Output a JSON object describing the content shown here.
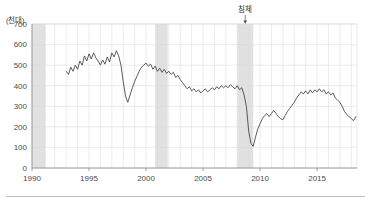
{
  "chart_data": {
    "type": "line",
    "title": "",
    "subtitle": "",
    "unit_label": "(천대)",
    "xlabel": "",
    "ylabel": "",
    "xlim": [
      1990,
      2018.5
    ],
    "ylim": [
      0,
      700
    ],
    "grid": true,
    "legend": false,
    "y_ticks": [
      0,
      100,
      200,
      300,
      400,
      500,
      600,
      700
    ],
    "y_tick_labels": [
      "0",
      "100",
      "200",
      "300",
      "400",
      "500",
      "600",
      "700"
    ],
    "x_ticks": [
      1990,
      1995,
      2000,
      2005,
      2010,
      2015
    ],
    "x_tick_labels": [
      "1990",
      "1995",
      "2000",
      "2005",
      "2010",
      "2015"
    ],
    "line_color": "#4a4a4a",
    "grid_color": "#d9d9d9",
    "axis_color": "#888888",
    "band_color": "#d6d6d6",
    "annotations": [
      {
        "name": "recession-annotation",
        "text": "침체",
        "x": 2008.7,
        "y": 700,
        "arrow": true
      }
    ],
    "shaded_bands": [
      {
        "name": "band-1990",
        "x0": 1990.0,
        "x1": 1991.2,
        "label": ""
      },
      {
        "name": "band-2001",
        "x0": 2000.8,
        "x1": 2001.9,
        "label": ""
      },
      {
        "name": "band-2008",
        "x0": 2008.0,
        "x1": 2009.4,
        "label": ""
      }
    ],
    "series": [
      {
        "name": "자동차 판매",
        "color": "#4a4a4a",
        "x": [
          1993.0,
          1993.2,
          1993.4,
          1993.6,
          1993.8,
          1994.0,
          1994.2,
          1994.4,
          1994.6,
          1994.8,
          1995.0,
          1995.2,
          1995.4,
          1995.6,
          1995.8,
          1996.0,
          1996.2,
          1996.4,
          1996.6,
          1996.8,
          1997.0,
          1997.2,
          1997.4,
          1997.6,
          1997.8,
          1998.0,
          1998.2,
          1998.4,
          1998.6,
          1998.8,
          1999.0,
          1999.2,
          1999.4,
          1999.6,
          1999.8,
          2000.0,
          2000.2,
          2000.4,
          2000.6,
          2000.8,
          2001.0,
          2001.2,
          2001.4,
          2001.6,
          2001.8,
          2002.0,
          2002.2,
          2002.4,
          2002.6,
          2002.8,
          2003.0,
          2003.2,
          2003.4,
          2003.6,
          2003.8,
          2004.0,
          2004.2,
          2004.4,
          2004.6,
          2004.8,
          2005.0,
          2005.2,
          2005.4,
          2005.6,
          2005.8,
          2006.0,
          2006.2,
          2006.4,
          2006.6,
          2006.8,
          2007.0,
          2007.2,
          2007.4,
          2007.6,
          2007.8,
          2008.0,
          2008.2,
          2008.4,
          2008.6,
          2008.8,
          2009.0,
          2009.2,
          2009.4,
          2009.6,
          2009.8,
          2010.0,
          2010.2,
          2010.4,
          2010.6,
          2010.8,
          2011.0,
          2011.2,
          2011.4,
          2011.6,
          2011.8,
          2012.0,
          2012.2,
          2012.4,
          2012.6,
          2012.8,
          2013.0,
          2013.2,
          2013.4,
          2013.6,
          2013.8,
          2014.0,
          2014.2,
          2014.4,
          2014.6,
          2014.8,
          2015.0,
          2015.2,
          2015.4,
          2015.6,
          2015.8,
          2016.0,
          2016.2,
          2016.4,
          2016.6,
          2016.8,
          2017.0,
          2017.2,
          2017.4,
          2017.6,
          2017.8,
          2018.0,
          2018.2,
          2018.4
        ],
        "values": [
          470,
          455,
          490,
          470,
          500,
          480,
          520,
          500,
          545,
          520,
          555,
          530,
          560,
          535,
          520,
          500,
          525,
          505,
          540,
          515,
          560,
          540,
          570,
          545,
          500,
          420,
          350,
          320,
          355,
          390,
          420,
          445,
          470,
          490,
          500,
          510,
          495,
          505,
          480,
          495,
          470,
          485,
          465,
          480,
          460,
          470,
          455,
          465,
          440,
          450,
          430,
          415,
          400,
          385,
          395,
          375,
          385,
          370,
          380,
          365,
          375,
          385,
          370,
          380,
          390,
          380,
          395,
          385,
          400,
          390,
          400,
          390,
          405,
          395,
          385,
          400,
          380,
          390,
          355,
          300,
          180,
          120,
          105,
          150,
          190,
          215,
          240,
          255,
          265,
          250,
          265,
          280,
          265,
          250,
          240,
          235,
          255,
          275,
          290,
          305,
          320,
          340,
          355,
          370,
          360,
          375,
          360,
          380,
          365,
          380,
          370,
          385,
          370,
          380,
          360,
          370,
          355,
          365,
          340,
          330,
          320,
          300,
          275,
          260,
          250,
          240,
          230,
          250
        ]
      }
    ]
  }
}
